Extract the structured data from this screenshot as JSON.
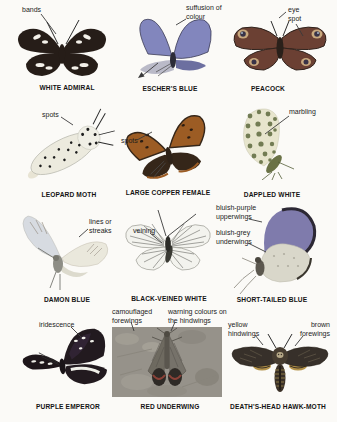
{
  "page": {
    "background": "#fbfaf7"
  },
  "specimens": [
    {
      "name": "WHITE ADMIRAL",
      "labels": [
        "bands"
      ]
    },
    {
      "name": "ESCHER'S BLUE",
      "labels": [
        "suffusion of colour"
      ]
    },
    {
      "name": "PEACOCK",
      "labels": [
        "eye spot"
      ]
    },
    {
      "name": "LEOPARD MOTH",
      "labels": [
        "spots"
      ]
    },
    {
      "name": "LARGE COPPER FEMALE",
      "labels": [
        "spots"
      ]
    },
    {
      "name": "DAPPLED WHITE",
      "labels": [
        "marbling"
      ]
    },
    {
      "name": "DAMON BLUE",
      "labels": [
        "lines or streaks"
      ]
    },
    {
      "name": "BLACK-VEINED WHITE",
      "labels": [
        "veining"
      ]
    },
    {
      "name": "SHORT-TAILED BLUE",
      "labels": [
        "bluish-purple upperwings",
        "bluish-grey underwings"
      ]
    },
    {
      "name": "PURPLE EMPEROR",
      "labels": [
        "iridescence"
      ]
    },
    {
      "name": "RED UNDERWING",
      "labels": [
        "camouflaged forewings",
        "warning colours on the hindwings"
      ]
    },
    {
      "name": "DEATH'S-HEAD HAWK-MOTH",
      "labels": [
        "yellow hindwings",
        "brown forewings"
      ]
    }
  ],
  "colors": {
    "white_admiral_wing": "#261d18",
    "white_admiral_band": "#f4f1ea",
    "eschers_blue_wing": "#8286bd",
    "eschers_blue_underside": "#babac8",
    "peacock_wing": "#6b4033",
    "peacock_eyespot_ring": "#c9a97e",
    "peacock_eyespot_core": "#393347",
    "leopard_wing": "#eceade",
    "leopard_spot": "#1e1e1e",
    "copper_wing": "#9c5c24",
    "copper_margin": "#352619",
    "dappled_base": "#e7e5cd",
    "dappled_marble": "#5e6a3e",
    "damon_wing": "#d7dbe1",
    "damon_streak": "#9a9288",
    "bv_white_wing": "#f3f3ee",
    "bv_white_vein": "#4d4d48",
    "st_blue_upperwing": "#7f7bac",
    "st_blue_underwing": "#d9d7ca",
    "emperor_wing": "#221a1f",
    "emperor_band": "#efefe8",
    "underwing_photo_bg": "#96928a",
    "underwing_hindwing_band": "#8a4238",
    "hawkmoth_wing": "#37302a",
    "hawkmoth_hindwing": "#b3924a"
  }
}
